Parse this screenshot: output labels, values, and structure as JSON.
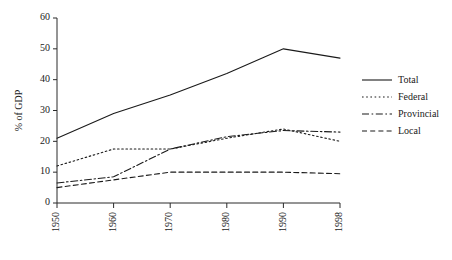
{
  "chart_data": {
    "type": "line",
    "title": "",
    "subtitle": "",
    "xlabel": "",
    "ylabel": "% of GDP",
    "x": [
      1950,
      1960,
      1970,
      1980,
      1990,
      1998
    ],
    "categories": [
      "1950",
      "1960",
      "1970",
      "1980",
      "1990",
      "1998"
    ],
    "xtick_labels": [
      "1950",
      "1960",
      "1970",
      "1980",
      "1990",
      "1998"
    ],
    "ytick_labels": [
      "0",
      "10",
      "20",
      "30",
      "40",
      "50",
      "60"
    ],
    "yticks": [
      0,
      10,
      20,
      30,
      40,
      50,
      60
    ],
    "ylim": [
      0,
      60
    ],
    "xlim": [
      1950,
      1998
    ],
    "grid": false,
    "legend_position": "right",
    "series": [
      {
        "name": "Total",
        "style": "solid",
        "color": "#1a1a1a",
        "values": [
          21,
          29,
          35,
          42,
          50,
          47
        ]
      },
      {
        "name": "Federal",
        "style": "dotted",
        "color": "#1a1a1a",
        "values": [
          12,
          17.5,
          17.5,
          21,
          24,
          20
        ]
      },
      {
        "name": "Provincial",
        "style": "dashdot",
        "color": "#1a1a1a",
        "values": [
          6.5,
          8.5,
          17.5,
          21.5,
          23.5,
          23
        ]
      },
      {
        "name": "Local",
        "style": "dashed",
        "color": "#1a1a1a",
        "values": [
          5,
          7.5,
          10,
          10,
          10,
          9.5
        ]
      }
    ]
  },
  "legend": {
    "entries": [
      {
        "label": "Total",
        "style": "solid"
      },
      {
        "label": "Federal",
        "style": "dotted"
      },
      {
        "label": "Provincial",
        "style": "dashdot"
      },
      {
        "label": "Local",
        "style": "dashed"
      }
    ]
  },
  "colors": {
    "ink": "#1a1a1a",
    "axis": "#2b2b2b",
    "background": "#ffffff"
  }
}
